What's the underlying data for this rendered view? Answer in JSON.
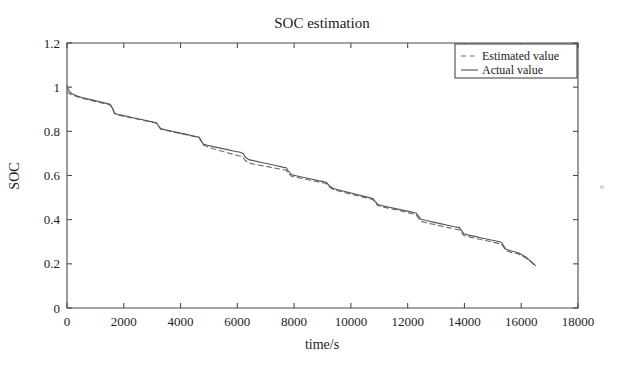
{
  "figure": {
    "title": "SOC estimation",
    "background": "#ffffff",
    "width": 624,
    "height": 365
  },
  "axes": {
    "x_title": "time/s",
    "y_title": "SOC",
    "x_ticks": [
      "0",
      "2000",
      "4000",
      "6000",
      "8000",
      "10000",
      "12000",
      "14000",
      "16000",
      "18000"
    ],
    "y_ticks": [
      "0",
      "0.2",
      "0.4",
      "0.6",
      "0.8",
      "1",
      "1.2"
    ]
  },
  "legend": {
    "items": [
      {
        "label": "Estimated value",
        "style": "dashed",
        "color": "#6e6e6e"
      },
      {
        "label": "Actual value",
        "style": "solid",
        "color": "#565656"
      }
    ]
  },
  "chart_data": {
    "type": "line",
    "title": "SOC estimation",
    "xlabel": "time/s",
    "ylabel": "SOC",
    "xlim": [
      0,
      18000
    ],
    "ylim": [
      0,
      1.2
    ],
    "xticks": [
      0,
      2000,
      4000,
      6000,
      8000,
      10000,
      12000,
      14000,
      16000,
      18000
    ],
    "yticks": [
      0,
      0.2,
      0.4,
      0.6,
      0.8,
      1.0,
      1.2
    ],
    "grid": false,
    "legend_position": "top-right",
    "series": [
      {
        "name": "Actual value",
        "style": "solid",
        "color": "#565656",
        "x": [
          0,
          60,
          150,
          260,
          400,
          560,
          750,
          950,
          1150,
          1350,
          1520,
          1600,
          1680,
          1800,
          2000,
          2250,
          2500,
          2750,
          3000,
          3150,
          3220,
          3300,
          3500,
          3750,
          4000,
          4250,
          4500,
          4650,
          4720,
          4800,
          4950,
          5150,
          5400,
          5650,
          5900,
          6100,
          6200,
          6280,
          6400,
          6600,
          6850,
          7100,
          7350,
          7600,
          7720,
          7800,
          7900,
          8100,
          8350,
          8600,
          8850,
          9050,
          9150,
          9250,
          9400,
          9650,
          9900,
          10150,
          10400,
          10650,
          10780,
          10860,
          10950,
          11150,
          11400,
          11650,
          11900,
          12150,
          12300,
          12380,
          12470,
          12650,
          12900,
          13150,
          13400,
          13650,
          13820,
          13900,
          13980,
          14150,
          14400,
          14650,
          14900,
          15150,
          15300,
          15380,
          15460,
          15650,
          15900,
          16150,
          16350,
          16500
        ],
        "y": [
          1.005,
          0.985,
          0.972,
          0.965,
          0.958,
          0.952,
          0.946,
          0.94,
          0.934,
          0.928,
          0.922,
          0.905,
          0.882,
          0.876,
          0.871,
          0.864,
          0.857,
          0.85,
          0.843,
          0.839,
          0.826,
          0.812,
          0.806,
          0.799,
          0.792,
          0.785,
          0.778,
          0.774,
          0.76,
          0.742,
          0.737,
          0.731,
          0.724,
          0.717,
          0.71,
          0.705,
          0.7,
          0.684,
          0.672,
          0.666,
          0.659,
          0.652,
          0.645,
          0.638,
          0.635,
          0.62,
          0.604,
          0.598,
          0.591,
          0.584,
          0.577,
          0.572,
          0.568,
          0.552,
          0.54,
          0.532,
          0.524,
          0.516,
          0.508,
          0.5,
          0.496,
          0.482,
          0.468,
          0.462,
          0.455,
          0.448,
          0.441,
          0.434,
          0.43,
          0.416,
          0.402,
          0.396,
          0.389,
          0.382,
          0.375,
          0.368,
          0.364,
          0.35,
          0.336,
          0.33,
          0.323,
          0.316,
          0.309,
          0.302,
          0.298,
          0.282,
          0.266,
          0.258,
          0.25,
          0.232,
          0.21,
          0.192
        ]
      },
      {
        "name": "Estimated value",
        "style": "dashed",
        "color": "#6e6e6e",
        "x": [
          0,
          60,
          150,
          260,
          400,
          560,
          750,
          950,
          1150,
          1350,
          1520,
          1600,
          1680,
          1800,
          2000,
          2250,
          2500,
          2750,
          3000,
          3150,
          3220,
          3300,
          3500,
          3750,
          4000,
          4250,
          4500,
          4650,
          4720,
          4800,
          4950,
          5150,
          5400,
          5650,
          5900,
          6100,
          6200,
          6280,
          6400,
          6600,
          6850,
          7100,
          7350,
          7600,
          7720,
          7800,
          7900,
          8100,
          8350,
          8600,
          8850,
          9050,
          9150,
          9250,
          9400,
          9650,
          9900,
          10150,
          10400,
          10650,
          10780,
          10860,
          10950,
          11150,
          11400,
          11650,
          11900,
          12150,
          12300,
          12380,
          12470,
          12650,
          12900,
          13150,
          13400,
          13650,
          13820,
          13900,
          13980,
          14150,
          14400,
          14650,
          14900,
          15150,
          15300,
          15380,
          15460,
          15650,
          15900,
          16150,
          16350,
          16500
        ],
        "y": [
          0.978,
          0.972,
          0.966,
          0.961,
          0.955,
          0.949,
          0.943,
          0.937,
          0.931,
          0.925,
          0.919,
          0.903,
          0.88,
          0.874,
          0.869,
          0.862,
          0.855,
          0.848,
          0.841,
          0.837,
          0.824,
          0.81,
          0.804,
          0.797,
          0.79,
          0.783,
          0.776,
          0.772,
          0.757,
          0.738,
          0.73,
          0.721,
          0.712,
          0.703,
          0.694,
          0.687,
          0.682,
          0.668,
          0.657,
          0.651,
          0.645,
          0.639,
          0.633,
          0.627,
          0.624,
          0.611,
          0.597,
          0.591,
          0.585,
          0.578,
          0.571,
          0.566,
          0.562,
          0.547,
          0.535,
          0.527,
          0.519,
          0.511,
          0.503,
          0.495,
          0.491,
          0.478,
          0.464,
          0.457,
          0.45,
          0.443,
          0.435,
          0.427,
          0.422,
          0.407,
          0.392,
          0.386,
          0.379,
          0.372,
          0.365,
          0.358,
          0.354,
          0.341,
          0.328,
          0.322,
          0.315,
          0.308,
          0.301,
          0.294,
          0.29,
          0.275,
          0.26,
          0.252,
          0.245,
          0.228,
          0.208,
          0.191
        ]
      }
    ]
  }
}
